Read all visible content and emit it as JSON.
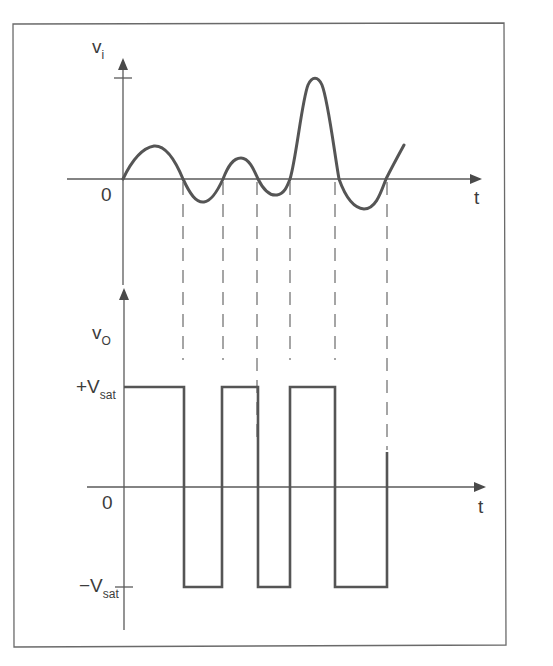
{
  "diagram": {
    "colors": {
      "frame": "#6a6a6a",
      "trace": "#555555",
      "text": "#3c3c3c",
      "background": "#ffffff"
    },
    "input_plot": {
      "y_axis_label": "v",
      "y_axis_subscript": "i",
      "origin_label": "0",
      "x_axis_label": "t",
      "description": "Irregular input voltage v_i crossing zero six times"
    },
    "output_plot": {
      "y_axis_label": "v",
      "y_axis_subscript": "O",
      "origin_label": "0",
      "x_axis_label": "t",
      "positive_level_label": "+V",
      "positive_level_subscript": "sat",
      "negative_level_label": "−V",
      "negative_level_subscript": "sat",
      "description": "Output toggles between +Vsat and -Vsat at each zero crossing of v_i"
    },
    "zero_crossings": 6,
    "output_sequence": [
      "+Vsat",
      "-Vsat",
      "+Vsat",
      "-Vsat",
      "+Vsat",
      "-Vsat",
      "+Vsat"
    ]
  }
}
